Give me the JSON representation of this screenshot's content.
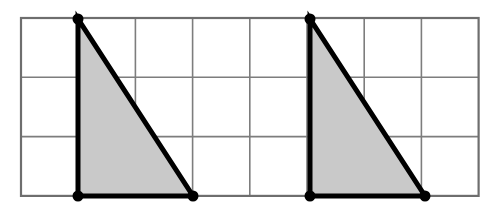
{
  "figure": {
    "background_color": "#ffffff",
    "canvas": {
      "width": 496,
      "height": 216
    }
  },
  "grid": {
    "name": "rectangular-grid",
    "origin_x": 21,
    "origin_y": 18,
    "cell_width": 57.2,
    "cell_height": 59.3,
    "columns": 8,
    "rows": 3,
    "line_color": "#7d7d7d",
    "line_width": 1.6,
    "border_color": "#6e6e6e",
    "border_width": 2.2,
    "fill_color": "#ffffff"
  },
  "shapes": {
    "fill_color": "#c9c9c9",
    "stroke_color": "#000000",
    "stroke_width": 5,
    "vertex_dot_color": "#000000",
    "vertex_dot_radius": 5.5,
    "triangles": [
      {
        "name": "left-triangle",
        "label": "Triangle 1",
        "type": "right-triangle",
        "base_cells": 2,
        "height_cells": 3,
        "grid_vertices": [
          [
            1,
            0
          ],
          [
            1,
            3
          ],
          [
            3,
            3
          ]
        ],
        "pixel_vertices": [
          [
            78,
            19
          ],
          [
            78,
            196
          ],
          [
            193,
            196
          ]
        ],
        "right_angle_at": [
          1,
          3
        ]
      },
      {
        "name": "right-triangle",
        "label": "Triangle 2",
        "type": "right-triangle",
        "base_cells": 2,
        "height_cells": 3,
        "grid_vertices": [
          [
            5,
            0
          ],
          [
            5,
            3
          ],
          [
            7,
            3
          ]
        ],
        "pixel_vertices": [
          [
            310,
            19
          ],
          [
            310,
            196
          ],
          [
            425,
            196
          ]
        ],
        "right_angle_at": [
          5,
          3
        ]
      }
    ]
  }
}
